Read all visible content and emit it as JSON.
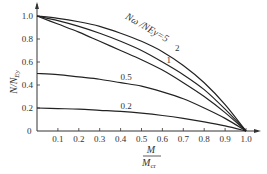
{
  "chart_data": {
    "type": "line",
    "title": "",
    "xlabel_num": "M",
    "xlabel_den": "M",
    "xlabel_den_sub": "cr",
    "ylabel": "N/N",
    "ylabel_sub": "Ey",
    "xlim": [
      0,
      1.0
    ],
    "ylim": [
      0,
      1.0
    ],
    "origin_label": "0",
    "xticks": [
      "0.1",
      "0.2",
      "0.3",
      "0.4",
      "0.5",
      "0.6",
      "0.7",
      "0.8",
      "0.9",
      "1.0"
    ],
    "yticks": [
      "0.2",
      "0.4",
      "0.6",
      "0.8",
      "1.0"
    ],
    "series": [
      {
        "name": "Nω/NEy=5",
        "label": "Nω /NEy=5",
        "x": [
          0,
          0.1,
          0.2,
          0.3,
          0.4,
          0.5,
          0.6,
          0.7,
          0.8,
          0.9,
          1.0
        ],
        "y": [
          1.0,
          0.98,
          0.95,
          0.91,
          0.85,
          0.78,
          0.69,
          0.57,
          0.42,
          0.23,
          0
        ]
      },
      {
        "name": "Nω/NEy=2",
        "label": "2",
        "x": [
          0,
          0.1,
          0.2,
          0.3,
          0.4,
          0.5,
          0.6,
          0.7,
          0.8,
          0.9,
          1.0
        ],
        "y": [
          1.0,
          0.96,
          0.91,
          0.85,
          0.78,
          0.7,
          0.6,
          0.49,
          0.36,
          0.19,
          0
        ]
      },
      {
        "name": "Nω/NEy=1",
        "label": "1",
        "x": [
          0,
          0.1,
          0.2,
          0.3,
          0.4,
          0.5,
          0.6,
          0.7,
          0.8,
          0.9,
          1.0
        ],
        "y": [
          1.0,
          0.93,
          0.86,
          0.78,
          0.7,
          0.62,
          0.53,
          0.42,
          0.3,
          0.16,
          0
        ]
      },
      {
        "name": "Nω/NEy=0.5",
        "label": "0.5",
        "x": [
          0,
          0.1,
          0.2,
          0.3,
          0.4,
          0.5,
          0.6,
          0.7,
          0.8,
          0.9,
          1.0
        ],
        "y": [
          0.5,
          0.49,
          0.47,
          0.45,
          0.42,
          0.39,
          0.34,
          0.28,
          0.2,
          0.11,
          0
        ]
      },
      {
        "name": "Nω/NEy=0.2",
        "label": "0.2",
        "x": [
          0,
          0.1,
          0.2,
          0.3,
          0.4,
          0.5,
          0.6,
          0.7,
          0.8,
          0.9,
          1.0
        ],
        "y": [
          0.2,
          0.195,
          0.19,
          0.18,
          0.17,
          0.155,
          0.135,
          0.11,
          0.08,
          0.045,
          0
        ]
      }
    ],
    "grid": false,
    "legend": "inline curve labels"
  }
}
